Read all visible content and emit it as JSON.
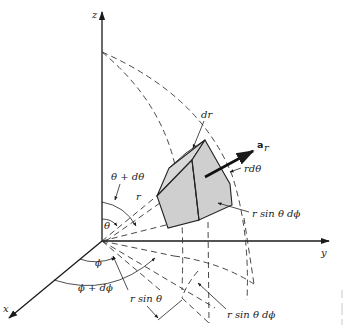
{
  "diagram": {
    "axes": {
      "x": "x",
      "y": "y",
      "z": "z"
    },
    "labels": {
      "dr": "dr",
      "a_r_main": "a",
      "a_r_sub": "r",
      "r_dtheta": "rdθ",
      "r_sin_theta_dphi_upper": "r sin θ dϕ",
      "r_sin_theta_dphi_lower": "r sin θ dϕ",
      "theta_plus_dtheta": "θ + dθ",
      "r": "r",
      "theta": "θ",
      "phi": "ϕ",
      "phi_plus_dphi": "ϕ + dϕ",
      "r_sin_theta": "r sin θ"
    },
    "colors": {
      "line": "#1a1a1a",
      "volume_fill": "#cfcfcf",
      "background": "#ffffff"
    }
  }
}
